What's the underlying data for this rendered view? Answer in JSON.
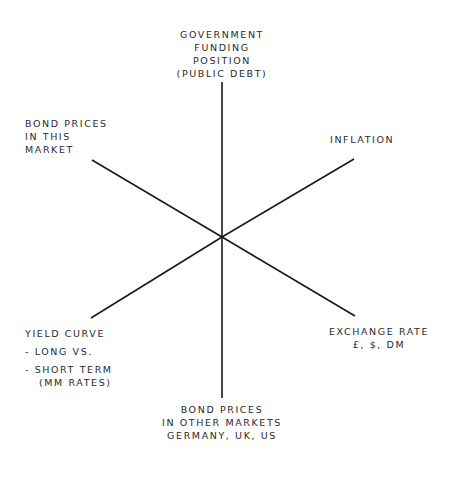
{
  "diagram": {
    "type": "radial-factor-diagram",
    "center": {
      "x": 222,
      "y": 237
    },
    "line_color": "#1a1a1a",
    "text_color": "#2a2a2a",
    "nodes": [
      {
        "id": "government-funding",
        "lines": [
          "GOVERNMENT",
          "FUNDING",
          "POSITION",
          "(PUBLIC DEBT)"
        ]
      },
      {
        "id": "inflation",
        "lines": [
          "INFLATION"
        ]
      },
      {
        "id": "exchange-rate",
        "lines": [
          "EXCHANGE RATE",
          "£, $, DM"
        ]
      },
      {
        "id": "bond-prices-other-markets",
        "lines": [
          "BOND PRICES",
          "IN OTHER MARKETS",
          "GERMANY, UK, US"
        ]
      },
      {
        "id": "yield-curve",
        "lines": [
          "YIELD CURVE",
          "- LONG VS.",
          "- SHORT TERM",
          "(MM RATES)"
        ]
      },
      {
        "id": "bond-prices-this-market",
        "lines": [
          "BOND PRICES",
          "IN THIS",
          "MARKET"
        ]
      }
    ],
    "spokes": [
      {
        "to": "government-funding",
        "x1": 222,
        "y1": 237,
        "x2": 222,
        "y2": 82
      },
      {
        "to": "inflation",
        "x1": 222,
        "y1": 237,
        "x2": 354,
        "y2": 159
      },
      {
        "to": "exchange-rate",
        "x1": 222,
        "y1": 237,
        "x2": 355,
        "y2": 316
      },
      {
        "to": "bond-prices-other-markets",
        "x1": 222,
        "y1": 237,
        "x2": 222,
        "y2": 398
      },
      {
        "to": "yield-curve",
        "x1": 222,
        "y1": 237,
        "x2": 91,
        "y2": 318
      },
      {
        "to": "bond-prices-this-market",
        "x1": 222,
        "y1": 237,
        "x2": 92,
        "y2": 160
      }
    ]
  }
}
